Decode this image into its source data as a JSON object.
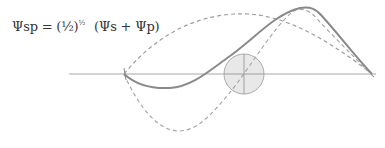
{
  "formula": {
    "lhs": "Ψsp = (½)",
    "exponent": "½",
    "rhs": "(Ψs + Ψp)"
  },
  "diagram": {
    "axis": {
      "x1": 69,
      "x2": 376,
      "y": 74,
      "color": "#bdbdbd"
    },
    "node_circle": {
      "cx": 244,
      "cy": 74,
      "r": 20,
      "fill": "#e6e6e6",
      "stroke": "#a8a8a8"
    },
    "curves": [
      {
        "name": "psi-sp",
        "style": "solid",
        "color": "#8c8c8c",
        "label": "Ψsp"
      },
      {
        "name": "psi-s",
        "style": "dashed",
        "color": "#9a9a9a",
        "label": "Ψs"
      },
      {
        "name": "psi-p",
        "style": "dashed",
        "color": "#9a9a9a",
        "label": "Ψp"
      }
    ]
  }
}
